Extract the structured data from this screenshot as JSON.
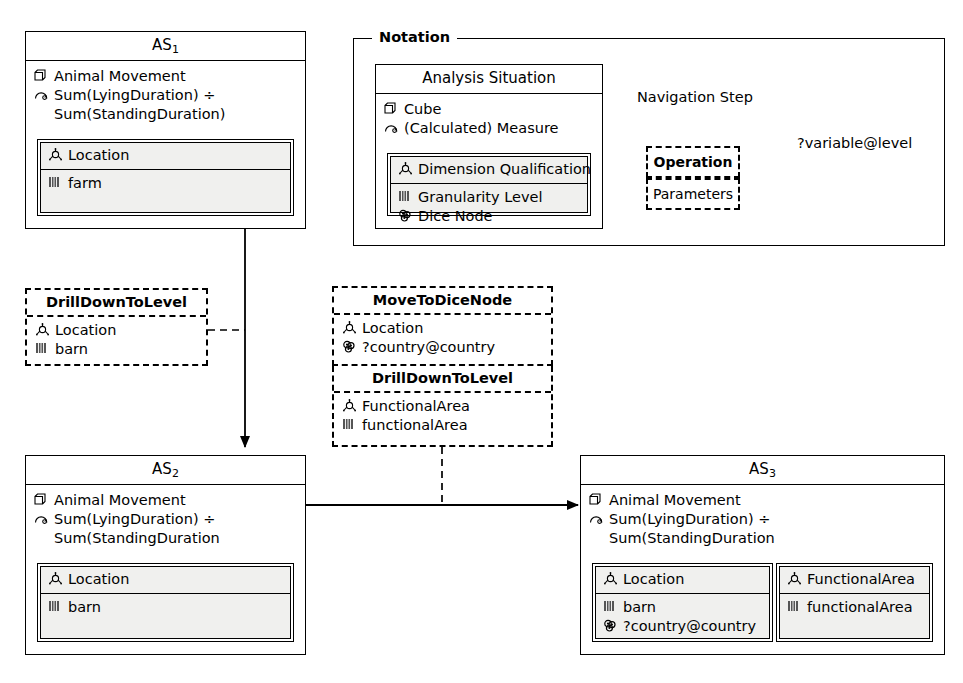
{
  "notation": {
    "frame_label": "Notation",
    "legend_box": {
      "title": "Analysis Situation",
      "measures": [
        {
          "icon": "cube-icon",
          "label": "Cube"
        },
        {
          "icon": "measure-gauge-icon",
          "label": "(Calculated) Measure"
        }
      ],
      "dimension_head": {
        "icon": "dimension-qualification-icon",
        "label": "Dimension Qualification"
      },
      "dimension_items": [
        {
          "icon": "granularity-level-icon",
          "label": "Granularity Level"
        },
        {
          "icon": "dice-node-icon",
          "label": "Dice Node"
        }
      ]
    },
    "navigation_step_label": "Navigation Step",
    "operation_label": "Operation",
    "parameters_label": "Parameters",
    "variable_label": "?variable@level"
  },
  "situations": [
    {
      "id": "as1",
      "title": "AS",
      "subscript": "1",
      "cube": {
        "icon": "cube-icon",
        "label": "Animal Movement"
      },
      "measure": {
        "icon": "measure-gauge-icon",
        "label": "Sum(LyingDuration) ÷"
      },
      "measure_cont": "Sum(StandingDuration)",
      "dimensions": [
        {
          "head": {
            "icon": "dimension-qualification-icon",
            "label": "Location"
          },
          "items": [
            {
              "icon": "granularity-level-icon",
              "label": "farm"
            }
          ]
        }
      ]
    },
    {
      "id": "as2",
      "title": "AS",
      "subscript": "2",
      "cube": {
        "icon": "cube-icon",
        "label": "Animal Movement"
      },
      "measure": {
        "icon": "measure-gauge-icon",
        "label": "Sum(LyingDuration) ÷"
      },
      "measure_cont": "Sum(StandingDuration",
      "dimensions": [
        {
          "head": {
            "icon": "dimension-qualification-icon",
            "label": "Location"
          },
          "items": [
            {
              "icon": "granularity-level-icon",
              "label": "barn"
            }
          ]
        }
      ]
    },
    {
      "id": "as3",
      "title": "AS",
      "subscript": "3",
      "cube": {
        "icon": "cube-icon",
        "label": "Animal Movement"
      },
      "measure": {
        "icon": "measure-gauge-icon",
        "label": "Sum(LyingDuration) ÷"
      },
      "measure_cont": "Sum(StandingDuration",
      "dimensions": [
        {
          "head": {
            "icon": "dimension-qualification-icon",
            "label": "Location"
          },
          "items": [
            {
              "icon": "granularity-level-icon",
              "label": "barn"
            },
            {
              "icon": "dice-node-icon",
              "label": "?country@country"
            }
          ]
        },
        {
          "head": {
            "icon": "dimension-qualification-icon",
            "label": "FunctionalArea"
          },
          "items": [
            {
              "icon": "granularity-level-icon",
              "label": "functionalArea"
            }
          ]
        }
      ]
    }
  ],
  "operations": {
    "op_left": {
      "name": "DrillDownToLevel",
      "params": [
        {
          "icon": "dimension-qualification-icon",
          "label": "Location"
        },
        {
          "icon": "granularity-level-icon",
          "label": "barn"
        }
      ]
    },
    "op_mid_first": {
      "name": "MoveToDiceNode",
      "params": [
        {
          "icon": "dimension-qualification-icon",
          "label": "Location"
        },
        {
          "icon": "dice-node-icon",
          "label": "?country@country"
        }
      ]
    },
    "op_mid_second": {
      "name": "DrillDownToLevel",
      "params": [
        {
          "icon": "dimension-qualification-icon",
          "label": "FunctionalArea"
        },
        {
          "icon": "granularity-level-icon",
          "label": "functionalArea"
        }
      ]
    }
  },
  "colors": {
    "stroke": "#000000",
    "dimension_fill": "#f0f0ee",
    "background": "#ffffff"
  }
}
